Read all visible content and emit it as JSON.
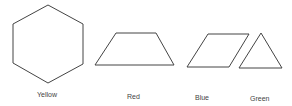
{
  "diagram": {
    "shapes": [
      {
        "id": "hexagon",
        "label": "Yellow",
        "points": "48,5 83,24 83,64 48,83 13,63 13,24",
        "label_x": 37,
        "label_y": 91
      },
      {
        "id": "trapezoid",
        "label": "Red",
        "points": "116,33 156,33 174,65 95,65",
        "label_x": 127,
        "label_y": 93
      },
      {
        "id": "parallelogram",
        "label": "Blue",
        "points": "208,34 249,34 229,67 187,67",
        "label_x": 195,
        "label_y": 94
      },
      {
        "id": "triangle",
        "label": "Green",
        "points": "261,33 282,68 239,68",
        "label_x": 250,
        "label_y": 95
      }
    ],
    "stroke_color": "#444444"
  }
}
